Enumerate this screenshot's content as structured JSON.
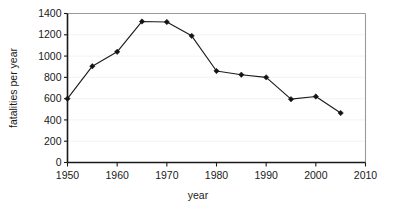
{
  "chart_data": {
    "type": "line",
    "title": "",
    "xlabel": "year",
    "ylabel": "fatalities  per year",
    "xlim": [
      1950,
      2010
    ],
    "ylim": [
      0,
      1400
    ],
    "grid": true,
    "legend": "none",
    "marker": "diamond",
    "x": [
      1950,
      1955,
      1960,
      1965,
      1970,
      1975,
      1980,
      1985,
      1990,
      1995,
      2000,
      2005
    ],
    "values": [
      600,
      905,
      1040,
      1325,
      1320,
      1190,
      860,
      825,
      800,
      595,
      620,
      465
    ],
    "series": [
      {
        "name": "fatalities per year",
        "values": [
          600,
          905,
          1040,
          1325,
          1320,
          1190,
          860,
          825,
          800,
          595,
          620,
          465
        ]
      }
    ],
    "xticks": [
      1950,
      1960,
      1970,
      1980,
      1990,
      2000,
      2010
    ],
    "xtick_labels": [
      "1950",
      "1960",
      "1970",
      "1980",
      "1990",
      "2000",
      "2010"
    ],
    "yticks": [
      0,
      200,
      400,
      600,
      800,
      1000,
      1200,
      1400
    ],
    "ytick_labels": [
      "0",
      "200",
      "400",
      "600",
      "800",
      "1000",
      "1200",
      "1400"
    ],
    "colors": {
      "line": "#1c1c1c",
      "marker": "#141414",
      "axis": "#1a1a1a",
      "grid": "#ececed",
      "frame": "#9a9a9a",
      "background": "#ffffff"
    }
  }
}
